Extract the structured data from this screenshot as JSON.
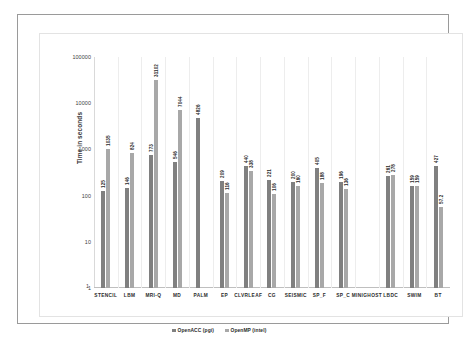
{
  "chart_data": {
    "type": "bar",
    "title": "",
    "xlabel": "",
    "ylabel": "Time in seconds",
    "yscale": "log",
    "ylim": [
      1,
      100000
    ],
    "yticks": [
      1,
      10,
      100,
      1000,
      10000,
      100000
    ],
    "ytick_labels": [
      "1",
      "10",
      "100",
      "1000",
      "10000",
      "100000"
    ],
    "grid": false,
    "legend_position": "bottom",
    "categories": [
      "STENCIL",
      "LBM",
      "MRI-Q",
      "MD",
      "PALM",
      "EP",
      "CLVRLEAF",
      "CG",
      "SEISMIC",
      "SP_F",
      "SP_C",
      "MINIGHOST",
      "LBDC",
      "SWIM",
      "BT"
    ],
    "series": [
      {
        "name": "OpenACC (pgi)",
        "color": "#808080",
        "values": [
          125,
          146,
          773,
          546,
          4826,
          209,
          440,
          221,
          200,
          405,
          196,
          null,
          261,
          159,
          427
        ]
      },
      {
        "name": "OpenMP (intel)",
        "color": "#a8a8a8",
        "values": [
          1035,
          824,
          31102,
          7044,
          null,
          116,
          338,
          106,
          160,
          188,
          136,
          null,
          278,
          159,
          57.2
        ]
      }
    ],
    "bar_labels": [
      [
        "125",
        "1035"
      ],
      [
        "146",
        "824"
      ],
      [
        "773",
        "31102"
      ],
      [
        "546",
        "7044"
      ],
      [
        "4826",
        ""
      ],
      [
        "209",
        "116"
      ],
      [
        "440",
        "338"
      ],
      [
        "221",
        "106"
      ],
      [
        "200",
        "160"
      ],
      [
        "405",
        "188"
      ],
      [
        "196",
        "136"
      ],
      [
        "",
        ""
      ],
      [
        "261",
        "278"
      ],
      [
        "159",
        "159"
      ],
      [
        "427",
        "57.2"
      ]
    ]
  },
  "axis": {
    "y_title": "Time in seconds",
    "x_base_tick": "1"
  },
  "legend": {
    "items": [
      {
        "label": "OpenACC (pgi)"
      },
      {
        "label": "OpenMP (intel)"
      }
    ]
  }
}
